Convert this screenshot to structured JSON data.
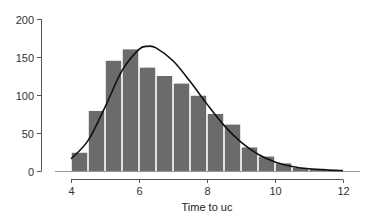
{
  "chart_data": {
    "type": "bar",
    "subtype": "histogram_with_density_curve",
    "title": "",
    "xlabel": "Time to uc",
    "ylabel": "",
    "xlim": [
      4,
      12
    ],
    "ylim": [
      0,
      200
    ],
    "xticks": [
      4,
      6,
      8,
      10,
      12
    ],
    "yticks": [
      0,
      50,
      100,
      150,
      200
    ],
    "bin_width": 0.5,
    "bins": [
      {
        "start": 4.0,
        "end": 4.5,
        "count": 24
      },
      {
        "start": 4.5,
        "end": 5.0,
        "count": 79
      },
      {
        "start": 5.0,
        "end": 5.5,
        "count": 145
      },
      {
        "start": 5.5,
        "end": 6.0,
        "count": 160
      },
      {
        "start": 6.0,
        "end": 6.5,
        "count": 136
      },
      {
        "start": 6.5,
        "end": 7.0,
        "count": 125
      },
      {
        "start": 7.0,
        "end": 7.5,
        "count": 115
      },
      {
        "start": 7.5,
        "end": 8.0,
        "count": 99
      },
      {
        "start": 8.0,
        "end": 8.5,
        "count": 75
      },
      {
        "start": 8.5,
        "end": 9.0,
        "count": 61
      },
      {
        "start": 9.0,
        "end": 9.5,
        "count": 31
      },
      {
        "start": 9.5,
        "end": 10.0,
        "count": 19
      },
      {
        "start": 10.0,
        "end": 10.5,
        "count": 10
      },
      {
        "start": 10.5,
        "end": 11.0,
        "count": 4
      },
      {
        "start": 11.0,
        "end": 11.5,
        "count": 3
      },
      {
        "start": 11.5,
        "end": 12.0,
        "count": 1
      }
    ],
    "curve": {
      "name": "fitted density",
      "x": [
        4.0,
        4.5,
        5.0,
        5.5,
        6.0,
        6.25,
        6.5,
        7.0,
        7.5,
        8.0,
        8.5,
        9.0,
        9.5,
        10.0,
        10.5,
        11.0,
        11.5,
        12.0
      ],
      "y": [
        16,
        40,
        84,
        132,
        160,
        164,
        162,
        145,
        118,
        88,
        60,
        38,
        22,
        12,
        6,
        3,
        1.5,
        0.5
      ]
    },
    "grid": false,
    "legend": null,
    "colors": {
      "bar": "#6b6b6b",
      "bar_edge": "#ffffff",
      "curve": "#111111",
      "axis": "#555555"
    }
  }
}
